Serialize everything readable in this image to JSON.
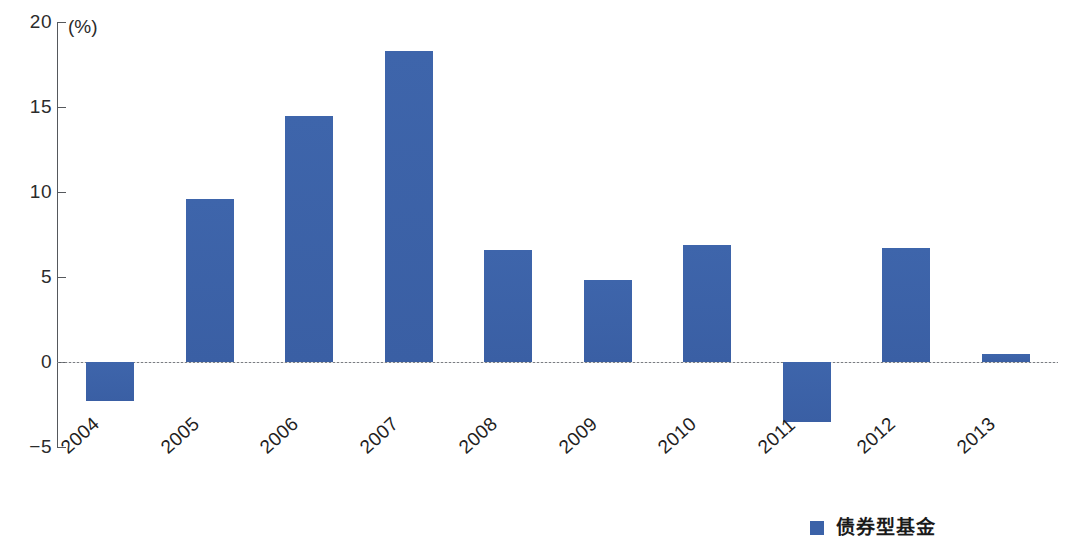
{
  "chart_data": {
    "type": "bar",
    "title": "",
    "subtitle": "",
    "xlabel": "",
    "ylabel": "",
    "unit_label": "(%)",
    "categories": [
      "2004",
      "2005",
      "2006",
      "2007",
      "2008",
      "2009",
      "2010",
      "2011",
      "2012",
      "2013"
    ],
    "values": [
      -2.3,
      9.6,
      14.5,
      18.3,
      6.6,
      4.8,
      6.9,
      -3.5,
      6.7,
      0.5
    ],
    "series": [
      {
        "name": "债券型基金",
        "color": "#3b62a8",
        "values": [
          -2.3,
          9.6,
          14.5,
          18.3,
          6.6,
          4.8,
          6.9,
          -3.5,
          6.7,
          0.5
        ]
      }
    ],
    "ylim": [
      -5,
      20
    ],
    "yticks": [
      20,
      15,
      10,
      5,
      0,
      -5
    ],
    "ytick_labels": [
      "20",
      "15",
      "10",
      "5",
      "0",
      "−5"
    ],
    "grid": false,
    "zero_line": true,
    "legend_position": "bottom-right"
  },
  "axis": {
    "unit": "(%)",
    "ticks": [
      {
        "label": "20",
        "value": 20
      },
      {
        "label": "15",
        "value": 15
      },
      {
        "label": "10",
        "value": 10
      },
      {
        "label": "5",
        "value": 5
      },
      {
        "label": "0",
        "value": 0
      },
      {
        "label": "−5",
        "value": -5
      }
    ]
  },
  "legend": {
    "items": [
      {
        "label": "债券型基金",
        "color": "#3b62a8"
      }
    ]
  },
  "colors": {
    "bar": "#3b62a8",
    "axis": "#55585c",
    "text": "#1f1f1f",
    "background": "#ffffff"
  }
}
